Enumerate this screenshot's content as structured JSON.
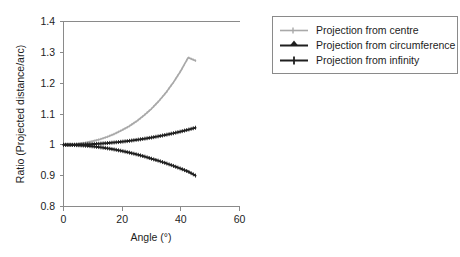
{
  "chart_data": {
    "type": "line",
    "title": "",
    "subtitle": "",
    "xlabel": "Angle (°)",
    "ylabel": "Ratio (Projected distance/arc)",
    "xlim": [
      0,
      60
    ],
    "ylim": [
      0.8,
      1.4
    ],
    "xticks": [
      0,
      20,
      40,
      60
    ],
    "xtick_labels": [
      "0",
      "20",
      "40",
      "60"
    ],
    "yticks": [
      0.8,
      0.9,
      1.0,
      1.1,
      1.2,
      1.3,
      1.4
    ],
    "ytick_labels": [
      "0.8",
      "0.9",
      "1",
      "1.1",
      "1.2",
      "1.3",
      "1.4"
    ],
    "grid": false,
    "legend_position": "right-top",
    "x": [
      0,
      2.5,
      5,
      7.5,
      10,
      12.5,
      15,
      17.5,
      20,
      22.5,
      25,
      27.5,
      30,
      32.5,
      35,
      37.5,
      40,
      42.5,
      45
    ],
    "series": [
      {
        "name": "Projection from centre",
        "color": "#a9a9a9",
        "marker": "small-tick",
        "values": [
          1.0,
          1.001,
          1.003,
          1.007,
          1.012,
          1.018,
          1.026,
          1.036,
          1.048,
          1.061,
          1.077,
          1.096,
          1.117,
          1.142,
          1.17,
          1.203,
          1.24,
          1.283,
          1.273
        ]
      },
      {
        "name": "Projection from circumference",
        "color": "#1f1f1f",
        "marker": "small-tick",
        "values": [
          1.0,
          1.0002,
          1.0006,
          1.0014,
          1.0025,
          1.0039,
          1.0057,
          1.0078,
          1.0102,
          1.013,
          1.0162,
          1.0197,
          1.0236,
          1.0279,
          1.0326,
          1.0377,
          1.0432,
          1.0491,
          1.0555
        ]
      },
      {
        "name": "Projection from infinity",
        "color": "#1f1f1f",
        "marker": "small-tick",
        "values": [
          1.0,
          0.99968,
          0.99873,
          0.99714,
          0.99493,
          0.9921,
          0.98865,
          0.98459,
          0.97993,
          0.97468,
          0.96885,
          0.96246,
          0.95493,
          0.94805,
          0.94008,
          0.93161,
          0.92266,
          0.91325,
          0.90032
        ]
      }
    ]
  },
  "legend": {
    "entries": [
      {
        "label": "Projection from centre"
      },
      {
        "label": "Projection from circumference"
      },
      {
        "label": "Projection from infinity"
      }
    ]
  },
  "axes": {
    "x_title": "Angle (°)",
    "y_title": "Ratio (Projected distance/arc)",
    "x_tick_labels": [
      "0",
      "20",
      "40",
      "60"
    ],
    "y_tick_labels": [
      "1.4",
      "1.3",
      "1.2",
      "1.1",
      "1",
      "0.9",
      "0.8"
    ]
  },
  "colors": {
    "series_centre": "#a9a9a9",
    "series_circumference": "#1f1f1f",
    "series_infinity": "#1f1f1f",
    "axis": "#8a8a8a",
    "text": "#1d1d1d",
    "background": "#ffffff"
  }
}
